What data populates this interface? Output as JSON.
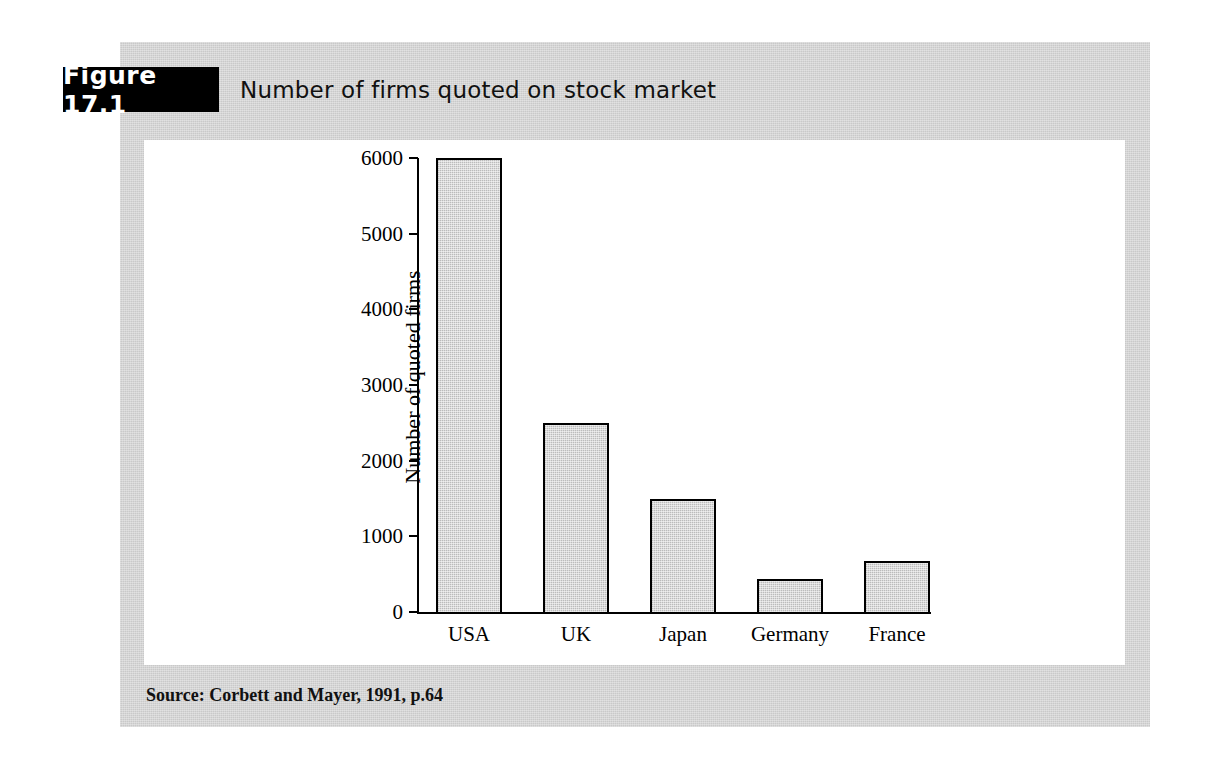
{
  "figure": {
    "tag_label": "Figure 17.1",
    "caption": "Number of firms quoted on stock market",
    "source": "Source: Corbett and Mayer, 1991, p.64",
    "panel_color": "#c9c9c9",
    "canvas_color": "#ffffff",
    "tag_background": "#000000",
    "tag_text_color": "#ffffff"
  },
  "chart_data": {
    "type": "bar",
    "title": "Number of firms quoted on stock market",
    "xlabel": "",
    "ylabel": "Number of quoted firms",
    "categories": [
      "USA",
      "UK",
      "Japan",
      "Germany",
      "France"
    ],
    "values": [
      6000,
      2500,
      1500,
      430,
      670
    ],
    "ylim": [
      0,
      6000
    ],
    "yticks": [
      0,
      1000,
      2000,
      3000,
      4000,
      5000,
      6000
    ],
    "ytick_labels": [
      "0",
      "1000",
      "2000",
      "3000",
      "4000",
      "5000",
      "6000"
    ],
    "grid": false,
    "legend": false,
    "bar_fill_color": "#dadada",
    "bar_edge_color": "#000000"
  }
}
